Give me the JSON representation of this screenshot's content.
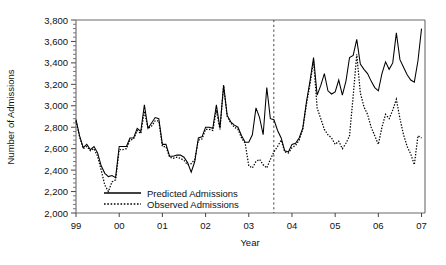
{
  "figure": {
    "background_color": "#ffffff",
    "axis_color": "#555555",
    "series_color": "#000000"
  },
  "chart_data": {
    "type": "line",
    "title": "",
    "xlabel": "Year",
    "ylabel": "Number of Admissions",
    "ylim": [
      2000,
      3800
    ],
    "ytick_labels": [
      "2,000",
      "2,200",
      "2,400",
      "2,600",
      "2,800",
      "3,000",
      "3,200",
      "3,400",
      "3,600",
      "3,800"
    ],
    "ytick_values": [
      2000,
      2200,
      2400,
      2600,
      2800,
      3000,
      3200,
      3400,
      3600,
      3800
    ],
    "yminor_step": 40,
    "xlim": [
      1999.0,
      2007.08
    ],
    "xtick_labels": [
      "99",
      "00",
      "01",
      "02",
      "03",
      "04",
      "05",
      "06",
      "07"
    ],
    "xtick_values": [
      1999,
      2000,
      2001,
      2002,
      2003,
      2004,
      2005,
      2006,
      2007
    ],
    "grid": false,
    "legend_position": "lower-left-inside",
    "annotations": [
      {
        "type": "vline",
        "label": "intervention",
        "x": 2003.58,
        "style": "dashed"
      }
    ],
    "x": [
      1999.0,
      1999.083,
      1999.167,
      1999.25,
      1999.333,
      1999.417,
      1999.5,
      1999.583,
      1999.667,
      1999.75,
      1999.833,
      1999.917,
      2000.0,
      2000.083,
      2000.167,
      2000.25,
      2000.333,
      2000.417,
      2000.5,
      2000.583,
      2000.667,
      2000.75,
      2000.833,
      2000.917,
      2001.0,
      2001.083,
      2001.167,
      2001.25,
      2001.333,
      2001.417,
      2001.5,
      2001.583,
      2001.667,
      2001.75,
      2001.833,
      2001.917,
      2002.0,
      2002.083,
      2002.167,
      2002.25,
      2002.333,
      2002.417,
      2002.5,
      2002.583,
      2002.667,
      2002.75,
      2002.833,
      2002.917,
      2003.0,
      2003.083,
      2003.167,
      2003.25,
      2003.333,
      2003.417,
      2003.5,
      2003.583,
      2003.667,
      2003.75,
      2003.833,
      2003.917,
      2004.0,
      2004.083,
      2004.167,
      2004.25,
      2004.333,
      2004.417,
      2004.5,
      2004.583,
      2004.667,
      2004.75,
      2004.833,
      2004.917,
      2005.0,
      2005.083,
      2005.167,
      2005.25,
      2005.333,
      2005.417,
      2005.5,
      2005.583,
      2005.667,
      2005.75,
      2005.833,
      2005.917,
      2006.0,
      2006.083,
      2006.167,
      2006.25,
      2006.333,
      2006.417,
      2006.5,
      2006.583,
      2006.667,
      2006.75,
      2006.833,
      2006.917,
      2007.0
    ],
    "series": [
      {
        "name": "Predicted Admissions",
        "style": "solid",
        "values": [
          2870,
          2720,
          2610,
          2640,
          2590,
          2620,
          2560,
          2440,
          2370,
          2340,
          2350,
          2330,
          2620,
          2620,
          2620,
          2700,
          2700,
          2790,
          2760,
          3010,
          2790,
          2840,
          2890,
          2880,
          2640,
          2640,
          2530,
          2530,
          2540,
          2540,
          2520,
          2470,
          2380,
          2480,
          2700,
          2710,
          2800,
          2800,
          2790,
          3010,
          2790,
          3190,
          2910,
          2850,
          2820,
          2800,
          2720,
          2660,
          2660,
          2730,
          2980,
          2890,
          2730,
          3170,
          2880,
          2870,
          2770,
          2700,
          2580,
          2570,
          2640,
          2650,
          2700,
          2790,
          3030,
          3230,
          3450,
          3100,
          3190,
          3300,
          3140,
          3110,
          3130,
          3240,
          3100,
          3230,
          3450,
          3470,
          3620,
          3390,
          3340,
          3300,
          3230,
          3170,
          3140,
          3300,
          3410,
          3340,
          3400,
          3680,
          3430,
          3360,
          3290,
          3240,
          3220,
          3420,
          3720
        ]
      },
      {
        "name": "Observed Admissions",
        "style": "dotted",
        "values": [
          2860,
          2710,
          2600,
          2620,
          2580,
          2600,
          2530,
          2400,
          2260,
          2200,
          2290,
          2310,
          2590,
          2590,
          2600,
          2680,
          2690,
          2770,
          2740,
          2950,
          2790,
          2810,
          2860,
          2860,
          2620,
          2620,
          2520,
          2510,
          2520,
          2510,
          2490,
          2450,
          2460,
          2500,
          2680,
          2690,
          2780,
          2780,
          2770,
          2960,
          2780,
          3190,
          2900,
          2840,
          2800,
          2780,
          2700,
          2650,
          2440,
          2420,
          2480,
          2500,
          2450,
          2420,
          2500,
          2570,
          2620,
          2680,
          2570,
          2560,
          2610,
          2630,
          2680,
          2780,
          3010,
          3200,
          3420,
          2980,
          2880,
          2780,
          2730,
          2700,
          2640,
          2670,
          2600,
          2650,
          2720,
          3090,
          3480,
          3120,
          2990,
          2920,
          2800,
          2720,
          2640,
          2800,
          2920,
          2880,
          2960,
          3060,
          2880,
          2730,
          2620,
          2550,
          2450,
          2720,
          2700
        ]
      }
    ]
  },
  "legend": {
    "items": [
      {
        "label": "Predicted Admissions",
        "style": "solid"
      },
      {
        "label": "Observed Admissions",
        "style": "dotted"
      }
    ]
  }
}
